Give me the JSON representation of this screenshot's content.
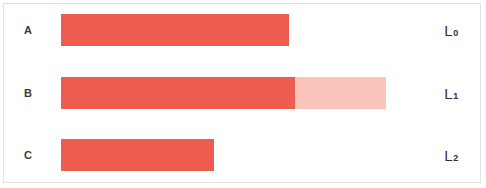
{
  "chart_data": {
    "type": "bar",
    "title": "",
    "subtitle": "",
    "xlabel": "",
    "ylabel": "",
    "orientation": "horizontal",
    "grid": false,
    "legend": false,
    "axis_range": [
      0,
      100
    ],
    "categories": [
      "A",
      "B",
      "C"
    ],
    "right_labels": [
      "L0",
      "L1",
      "L2"
    ],
    "colors": {
      "solid": "#ec5d50",
      "light": "#fac4bb",
      "card_background": "#ffffff",
      "card_border": "#e2e2e2",
      "label_text": "#3a3a3a"
    },
    "series": [
      {
        "name": "filled",
        "color": "#ec5d50",
        "values": [
          70,
          72,
          47
        ]
      },
      {
        "name": "remainder",
        "color": "#fac4bb",
        "values": [
          0,
          28,
          0
        ]
      }
    ],
    "bars": [
      {
        "category": "A",
        "right_label_base": "L",
        "right_label_sub": "0",
        "total": 70,
        "segments": [
          {
            "name": "filled",
            "value": 70,
            "color": "#ec5d50"
          }
        ]
      },
      {
        "category": "B",
        "right_label_base": "L",
        "right_label_sub": "1",
        "total": 100,
        "segments": [
          {
            "name": "filled",
            "value": 72,
            "color": "#ec5d50"
          },
          {
            "name": "remainder",
            "value": 28,
            "color": "#fac4bb"
          }
        ]
      },
      {
        "category": "C",
        "right_label_base": "L",
        "right_label_sub": "2",
        "total": 47,
        "segments": [
          {
            "name": "filled",
            "value": 47,
            "color": "#ec5d50"
          }
        ]
      }
    ]
  },
  "rows": [
    {
      "label": "A",
      "right_base": "L",
      "right_sub": "0"
    },
    {
      "label": "B",
      "right_base": "L",
      "right_sub": "1"
    },
    {
      "label": "C",
      "right_base": "L",
      "right_sub": "2"
    }
  ]
}
